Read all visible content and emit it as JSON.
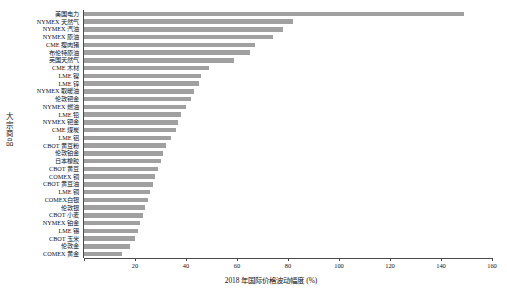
{
  "chart_data": {
    "type": "bar",
    "orientation": "horizontal",
    "title": "",
    "xlabel": "2018 年国际价格波动幅度 (%)",
    "ylabel": "大宗商品",
    "xlim": [
      0,
      160
    ],
    "xticks": [
      0,
      20,
      40,
      60,
      80,
      100,
      120,
      140,
      160
    ],
    "xticklabels": [
      "",
      "20",
      "40",
      "60",
      "80",
      "100",
      "120",
      "140",
      "160"
    ],
    "grid": false,
    "legend": false,
    "bar_color": "#a0a0a0",
    "categories": [
      "美国电力",
      "NYMEX 天然气",
      "NYMEX 汽油",
      "NYMEX 原油",
      "CME 瘦肉猪",
      "布伦特原油",
      "英国天然气",
      "CME 木材",
      "LME 镍",
      "LME 锌",
      "NYMEX 取暖油",
      "伦敦钯金",
      "NYMEX 燃油",
      "LME 铅",
      "NYMEX 钯金",
      "CME 煤炭",
      "LME 铝",
      "CBOT 黄豆粉",
      "伦敦铂金",
      "日本橡胶",
      "CBOT 黄豆",
      "COMEX 铜",
      "CBOT 黄豆油",
      "LME 铜",
      "COMEX白银",
      "伦敦银",
      "CBOT 小麦",
      "NYMEX 铂金",
      "LME 锡",
      "CBOT 玉米",
      "伦敦金",
      "COMEX 黄金"
    ],
    "values": [
      149,
      82,
      78,
      74,
      67,
      65,
      59,
      49,
      46,
      45,
      43,
      42,
      40,
      38,
      37,
      36,
      34,
      32,
      31,
      30,
      29,
      28,
      27,
      26,
      25,
      24,
      23,
      22,
      21,
      20,
      18,
      15
    ]
  }
}
